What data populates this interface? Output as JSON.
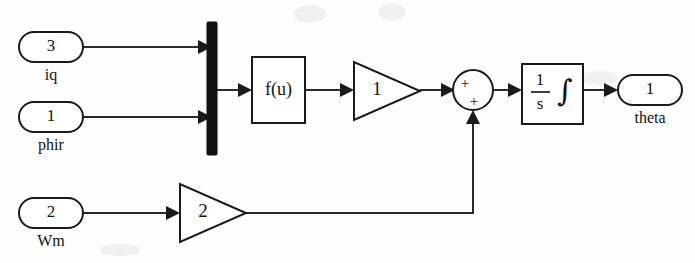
{
  "diagram": {
    "kind": "simulink-block-diagram",
    "background_color": "#fefefe",
    "line_color": "#2a2a2a",
    "block_color": "#1a1a1a",
    "mux_color": "#111111"
  },
  "inports": [
    {
      "name": "inport-iq",
      "number": "3",
      "label": "iq"
    },
    {
      "name": "inport-phir",
      "number": "1",
      "label": "phir"
    },
    {
      "name": "inport-wm",
      "number": "2",
      "label": "Wm"
    }
  ],
  "outports": [
    {
      "name": "outport-theta",
      "number": "1",
      "label": "theta"
    }
  ],
  "blocks": {
    "mux": {
      "label": "",
      "type": "mux"
    },
    "fcn": {
      "label": "f(u)",
      "type": "fcn"
    },
    "gain_top": {
      "label": "1",
      "type": "gain"
    },
    "gain_bottom": {
      "label": "2",
      "type": "gain"
    },
    "sum": {
      "type": "sum",
      "sign_top": "+",
      "sign_bottom": "+"
    },
    "integrator": {
      "type": "integrator",
      "numerator": "1",
      "denominator": "s",
      "symbol": "∫"
    }
  }
}
